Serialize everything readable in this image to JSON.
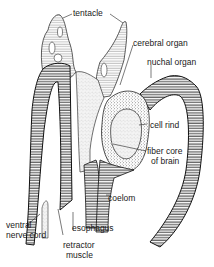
{
  "figure": {
    "labels": {
      "tentacle": "tentacle",
      "cerebral_organ": "cerebral organ",
      "nuchal_organ": "nuchal organ",
      "cell_rind": "cell rind",
      "fiber_core_1": "fiber core",
      "fiber_core_2": "of brain",
      "coelom": "coelom",
      "esophagus": "esophagus",
      "ventral_1": "ventral",
      "ventral_2": "nerve cord",
      "retractor_1": "retractor",
      "retractor_2": "muscle"
    },
    "colors": {
      "ink": "#1a1a1a",
      "hatch": "#333333",
      "background": "#ffffff"
    }
  }
}
